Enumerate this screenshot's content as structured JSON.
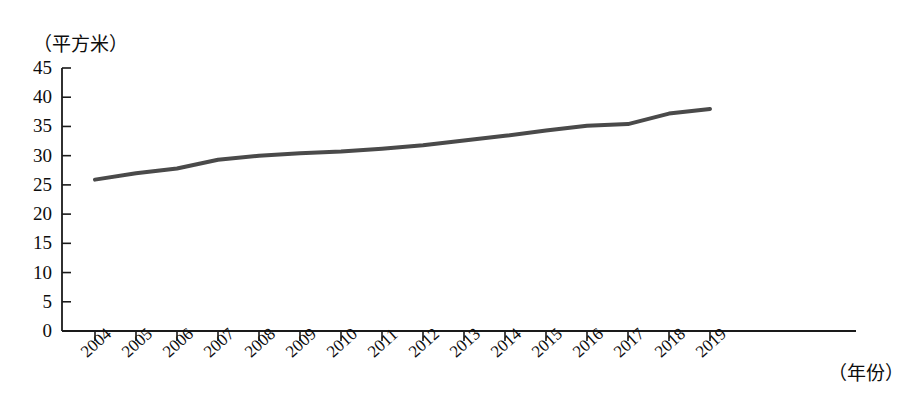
{
  "chart_data": {
    "type": "line",
    "title": "",
    "xlabel": "（年份）",
    "ylabel": "（平方米）",
    "x": [
      2004,
      2005,
      2006,
      2007,
      2008,
      2009,
      2010,
      2011,
      2012,
      2013,
      2014,
      2015,
      2016,
      2017,
      2018,
      2019
    ],
    "categories": [
      "2004",
      "2005",
      "2006",
      "2007",
      "2008",
      "2009",
      "2010",
      "2011",
      "2012",
      "2013",
      "2014",
      "2015",
      "2016",
      "2017",
      "2018",
      "2019"
    ],
    "values": [
      25.9,
      27.0,
      27.8,
      29.3,
      30.0,
      30.4,
      30.7,
      31.2,
      31.8,
      32.6,
      33.4,
      34.3,
      35.1,
      35.4,
      37.2,
      38.0
    ],
    "ylim": [
      0,
      45
    ],
    "ytick_values": [
      45,
      40,
      35,
      30,
      25,
      20,
      15,
      10,
      5,
      0
    ],
    "ytick_labels": [
      "45",
      "40",
      "35",
      "30",
      "25",
      "20",
      "15",
      "10",
      "5",
      "0"
    ],
    "grid": false,
    "legend": null,
    "series_color": "#4a4a4a",
    "axis_color": "#1a1a1a",
    "line_width": 4
  },
  "axes": {
    "y_unit_caption": "（平方米）",
    "x_unit_caption": "（年份）"
  }
}
